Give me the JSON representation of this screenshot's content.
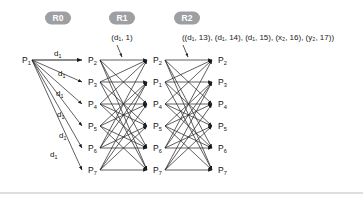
{
  "figure": {
    "background_color": "#ffffff",
    "pill_color": "#9d9fa2",
    "pill_text_color": "#ffffff",
    "edge_color": "#2b2b2b",
    "divider_color": "#b9bdc0"
  },
  "rounds": [
    {
      "id": "R0",
      "badge": "R0",
      "badge_x": 58,
      "badge_y": 18,
      "payload": "",
      "payload_x": 58,
      "payload_y": 40,
      "has_pointer": false
    },
    {
      "id": "R1",
      "badge": "R1",
      "badge_x": 122,
      "badge_y": 18,
      "payload": "(d₁, 1)",
      "payload_x": 122,
      "payload_y": 40,
      "has_pointer": true,
      "pointer": {
        "x1": 117,
        "y1": 45,
        "x2": 122,
        "y2": 57
      }
    },
    {
      "id": "R2",
      "badge": "R2",
      "badge_x": 187,
      "badge_y": 18,
      "payload": "((d₁, 13), (d₁, 14), (d₁, 15), (x₂, 16), (y₂, 17))",
      "payload_x": 258,
      "payload_y": 40,
      "has_pointer": true,
      "pointer": {
        "x1": 183,
        "y1": 45,
        "x2": 188,
        "y2": 57
      }
    }
  ],
  "columns": {
    "r0_source": {
      "x": 30,
      "y": 60,
      "label": "P",
      "sub": "1"
    },
    "r0_targets_x": 84,
    "r1_left_x": 99,
    "r1_right_x": 149,
    "r2_left_x": 164,
    "r2_right_x": 214,
    "row_ys": [
      60,
      82,
      104,
      126,
      148,
      170
    ]
  },
  "r0_targets": [
    {
      "label": "P",
      "sub": "2",
      "y": 60
    },
    {
      "label": "P",
      "sub": "3",
      "y": 82
    },
    {
      "label": "P",
      "sub": "4",
      "y": 104
    },
    {
      "label": "P",
      "sub": "5",
      "y": 126
    },
    {
      "label": "P",
      "sub": "6",
      "y": 148
    },
    {
      "label": "P",
      "sub": "7",
      "y": 170
    }
  ],
  "r0_edge_labels": [
    {
      "text": "d",
      "sub": "1",
      "x": 54,
      "y": 56
    },
    {
      "text": "d",
      "sub": "1",
      "x": 58,
      "y": 76
    },
    {
      "text": "d",
      "sub": "1",
      "x": 56,
      "y": 96
    },
    {
      "text": "d",
      "sub": "1",
      "x": 57,
      "y": 117
    },
    {
      "text": "d",
      "sub": "1",
      "x": 59,
      "y": 138
    },
    {
      "text": "d",
      "sub": "1",
      "x": 50,
      "y": 157
    }
  ],
  "r1_targets": [
    {
      "label": "P",
      "sub": "2",
      "y": 60
    },
    {
      "label": "P",
      "sub": "1",
      "y": 82
    },
    {
      "label": "P",
      "sub": "4",
      "y": 104
    },
    {
      "label": "P",
      "sub": "5",
      "y": 126
    },
    {
      "label": "P",
      "sub": "6",
      "y": 148
    },
    {
      "label": "P",
      "sub": "7",
      "y": 170
    }
  ],
  "r2_targets": [
    {
      "label": "P",
      "sub": "2",
      "y": 60
    },
    {
      "label": "P",
      "sub": "3",
      "y": 82
    },
    {
      "label": "P",
      "sub": "4",
      "y": 104
    },
    {
      "label": "P",
      "sub": "5",
      "y": 126
    },
    {
      "label": "P",
      "sub": "6",
      "y": 148
    },
    {
      "label": "P",
      "sub": "7",
      "y": 170
    }
  ],
  "divider": {
    "x1": 0,
    "y1": 193,
    "x2": 363,
    "y2": 193
  }
}
